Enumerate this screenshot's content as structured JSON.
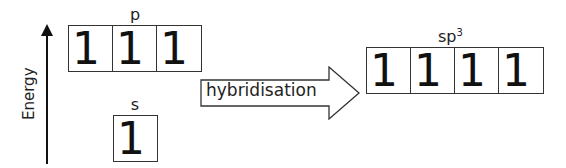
{
  "energy_axis": {
    "label": "Energy"
  },
  "p_orbitals": {
    "label": "p",
    "electrons": [
      "1",
      "1",
      "1"
    ]
  },
  "s_orbital": {
    "label": "s",
    "electrons": [
      "1"
    ]
  },
  "arrow": {
    "label": "hybridisation"
  },
  "sp3_orbitals": {
    "label_base": "sp",
    "label_sup": "3",
    "electrons": [
      "1",
      "1",
      "1",
      "1"
    ]
  }
}
